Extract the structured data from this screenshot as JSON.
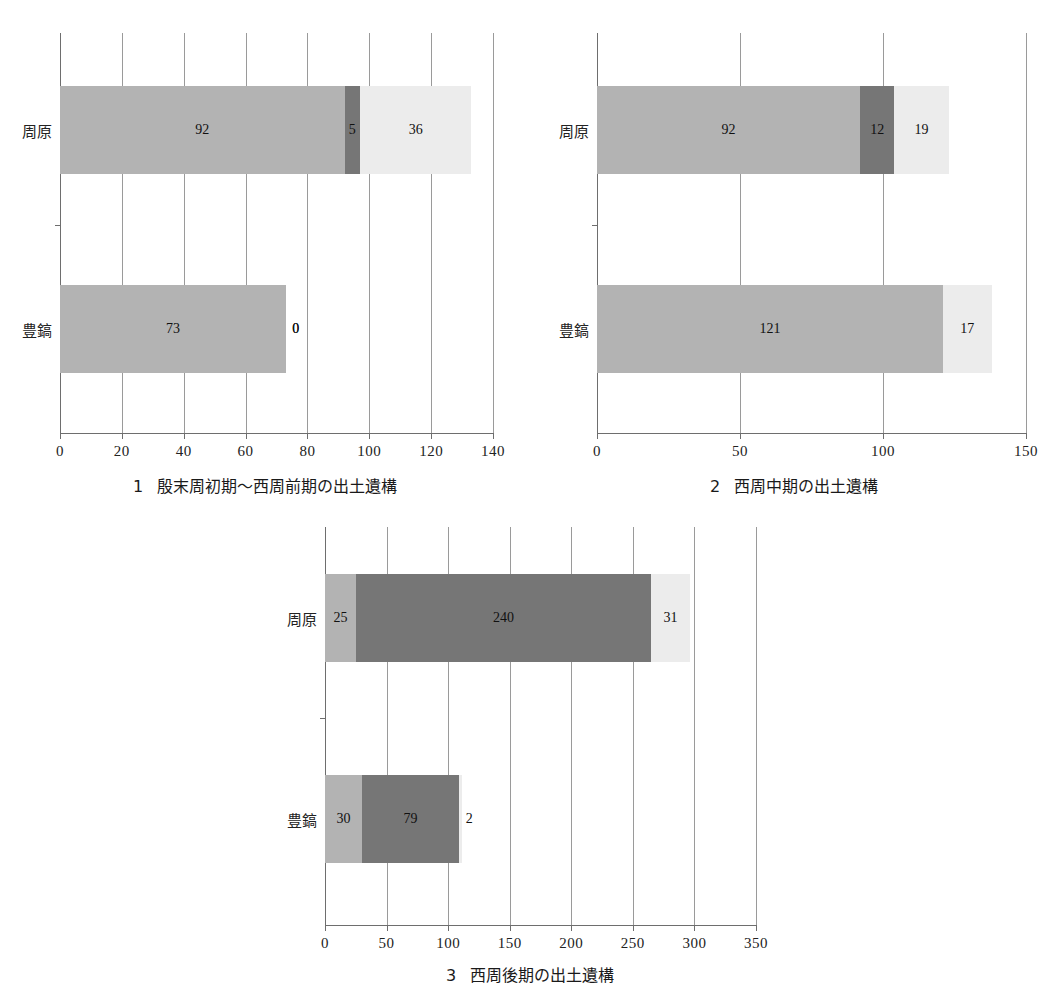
{
  "chart_data": [
    {
      "type": "bar",
      "orientation": "horizontal",
      "stacked": true,
      "index": "1",
      "title": "殷末周初期〜西周前期の出土遺構",
      "caption_number": "1",
      "categories": [
        "周原",
        "豊鎬"
      ],
      "series": [
        {
          "name": "series-1",
          "color": "#b3b3b3",
          "values": [
            92,
            73
          ]
        },
        {
          "name": "series-2",
          "color": "#767676",
          "values": [
            5,
            0
          ]
        },
        {
          "name": "series-3",
          "color": "#ececec",
          "values": [
            36,
            0
          ]
        }
      ],
      "xlabel": "",
      "ylabel": "",
      "xlim": [
        0,
        140
      ],
      "xticks": [
        0,
        20,
        40,
        60,
        80,
        100,
        120,
        140
      ],
      "xtick_labels": [
        "0",
        "20",
        "40",
        "60",
        "80",
        "100",
        "120",
        "140"
      ],
      "grid": true,
      "legend": "none",
      "data_labels": [
        [
          "92",
          "5",
          "36"
        ],
        [
          "73",
          "0",
          "0"
        ]
      ]
    },
    {
      "type": "bar",
      "orientation": "horizontal",
      "stacked": true,
      "index": "2",
      "title": "西周中期の出土遺構",
      "caption_number": "2",
      "categories": [
        "周原",
        "豊鎬"
      ],
      "series": [
        {
          "name": "series-1",
          "color": "#b3b3b3",
          "values": [
            92,
            121
          ]
        },
        {
          "name": "series-2",
          "color": "#767676",
          "values": [
            12,
            0
          ]
        },
        {
          "name": "series-3",
          "color": "#ececec",
          "values": [
            19,
            17
          ]
        }
      ],
      "xlabel": "",
      "ylabel": "",
      "xlim": [
        0,
        150
      ],
      "xticks": [
        0,
        50,
        100,
        150
      ],
      "xtick_labels": [
        "0",
        "50",
        "100",
        "150"
      ],
      "grid": true,
      "legend": "none",
      "data_labels": [
        [
          "92",
          "12",
          "19"
        ],
        [
          "121",
          "0",
          "17"
        ]
      ]
    },
    {
      "type": "bar",
      "orientation": "horizontal",
      "stacked": true,
      "index": "3",
      "title": "西周後期の出土遺構",
      "caption_number": "3",
      "categories": [
        "周原",
        "豊鎬"
      ],
      "series": [
        {
          "name": "series-1",
          "color": "#b3b3b3",
          "values": [
            25,
            30
          ]
        },
        {
          "name": "series-2",
          "color": "#767676",
          "values": [
            240,
            79
          ]
        },
        {
          "name": "series-3",
          "color": "#ececec",
          "values": [
            31,
            2
          ]
        }
      ],
      "xlabel": "",
      "ylabel": "",
      "xlim": [
        0,
        350
      ],
      "xticks": [
        0,
        50,
        100,
        150,
        200,
        250,
        300,
        350
      ],
      "xtick_labels": [
        "0",
        "50",
        "100",
        "150",
        "200",
        "250",
        "300",
        "350"
      ],
      "grid": true,
      "legend": "none",
      "data_labels": [
        [
          "25",
          "240",
          "31"
        ],
        [
          "30",
          "79",
          "2"
        ]
      ]
    }
  ]
}
